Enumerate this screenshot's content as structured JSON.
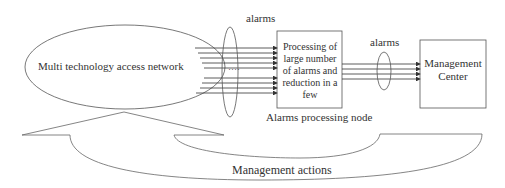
{
  "diagram": {
    "network": {
      "label": "Multi technology access network"
    },
    "alarms_left": {
      "label": "alarms",
      "ellipsis": "····"
    },
    "processing_node": {
      "text": [
        "Processing of",
        "large number",
        "of alarms and",
        "reduction in a",
        "few"
      ],
      "caption": "Alarms processing node"
    },
    "alarms_right": {
      "label": "alarms"
    },
    "management_center": {
      "text": [
        "Management",
        "Center"
      ]
    },
    "feedback": {
      "label": "Management actions"
    },
    "colors": {
      "stroke": "#555555",
      "text": "#333333",
      "background": "#ffffff"
    }
  }
}
